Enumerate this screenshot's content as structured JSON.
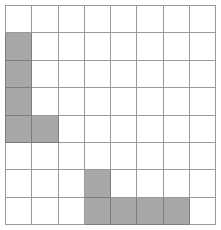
{
  "figure": {
    "type": "grid-shading-puzzle",
    "rows": 8,
    "columns": 8,
    "colors": {
      "background": "#ffffff",
      "grid_line": "#9a9a9a",
      "filled_cell": "#a8a8a8",
      "filled_cell_border": "#7d7d7d"
    },
    "cell_states": [
      [
        "empty",
        "empty",
        "empty",
        "empty",
        "empty",
        "empty",
        "empty",
        "empty"
      ],
      [
        "filled",
        "empty",
        "empty",
        "empty",
        "empty",
        "empty",
        "empty",
        "empty"
      ],
      [
        "filled",
        "empty",
        "empty",
        "empty",
        "empty",
        "empty",
        "empty",
        "empty"
      ],
      [
        "filled",
        "empty",
        "empty",
        "empty",
        "empty",
        "empty",
        "empty",
        "empty"
      ],
      [
        "filled",
        "filled",
        "empty",
        "empty",
        "empty",
        "empty",
        "empty",
        "empty"
      ],
      [
        "empty",
        "empty",
        "empty",
        "empty",
        "empty",
        "empty",
        "empty",
        "empty"
      ],
      [
        "empty",
        "empty",
        "empty",
        "filled",
        "empty",
        "empty",
        "empty",
        "empty"
      ],
      [
        "empty",
        "empty",
        "empty",
        "filled",
        "filled",
        "filled",
        "filled",
        "empty"
      ]
    ],
    "filled_count": 11
  }
}
